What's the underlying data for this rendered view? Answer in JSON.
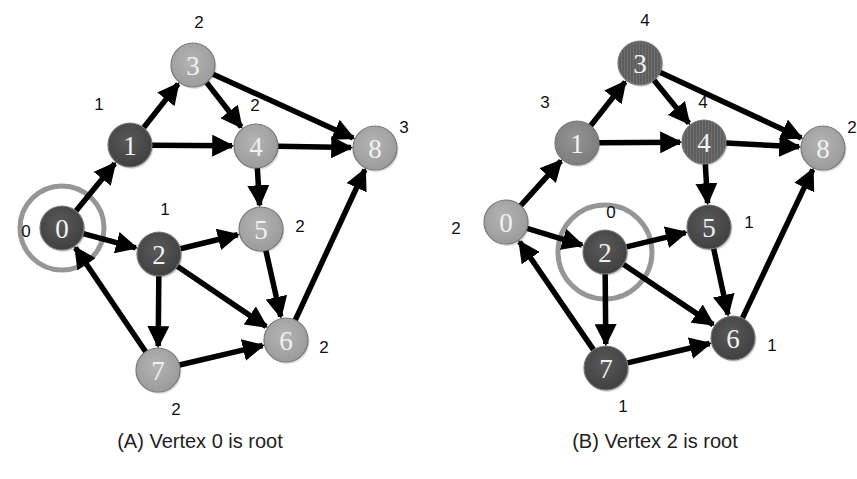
{
  "colors": {
    "dark": "#4d4d4d",
    "medium": "#8a8a8a",
    "light": "#a9a9a9",
    "striped": "#5e5e5e",
    "ring": "#969696",
    "edge": "#000000"
  },
  "edges": [
    [
      0,
      1
    ],
    [
      0,
      2
    ],
    [
      1,
      3
    ],
    [
      1,
      4
    ],
    [
      3,
      4
    ],
    [
      3,
      8
    ],
    [
      4,
      8
    ],
    [
      4,
      5
    ],
    [
      2,
      5
    ],
    [
      2,
      6
    ],
    [
      2,
      7
    ],
    [
      5,
      6
    ],
    [
      7,
      6
    ],
    [
      7,
      0
    ],
    [
      6,
      8
    ]
  ],
  "graphs": [
    {
      "id": "A",
      "caption": "(A) Vertex 0 is root",
      "caption_pos": [
        200,
        448
      ],
      "root": 0,
      "ring": {
        "cx": 62,
        "cy": 228,
        "r": 42
      },
      "nodes": [
        {
          "id": "0",
          "x": 62,
          "y": 228,
          "shade": "dark",
          "depth": "0",
          "lx": 26,
          "ly": 231
        },
        {
          "id": "1",
          "x": 130,
          "y": 145,
          "shade": "dark",
          "depth": "1",
          "lx": 99,
          "ly": 104
        },
        {
          "id": "2",
          "x": 159,
          "y": 254,
          "shade": "dark",
          "depth": "1",
          "lx": 165,
          "ly": 209
        },
        {
          "id": "3",
          "x": 193,
          "y": 65,
          "shade": "light",
          "depth": "2",
          "lx": 199,
          "ly": 22
        },
        {
          "id": "4",
          "x": 256,
          "y": 146,
          "shade": "light",
          "depth": "2",
          "lx": 255,
          "ly": 105
        },
        {
          "id": "5",
          "x": 261,
          "y": 229,
          "shade": "light",
          "depth": "2",
          "lx": 300,
          "ly": 226
        },
        {
          "id": "6",
          "x": 286,
          "y": 340,
          "shade": "light",
          "depth": "2",
          "lx": 324,
          "ly": 347
        },
        {
          "id": "7",
          "x": 158,
          "y": 370,
          "shade": "light",
          "depth": "2",
          "lx": 176,
          "ly": 409
        },
        {
          "id": "8",
          "x": 375,
          "y": 148,
          "shade": "light",
          "depth": "3",
          "lx": 404,
          "ly": 127
        }
      ]
    },
    {
      "id": "B",
      "caption": "(B) Vertex 2 is root",
      "caption_pos": [
        655,
        448
      ],
      "root": 2,
      "ring": {
        "cx": 605,
        "cy": 252,
        "r": 47
      },
      "nodes": [
        {
          "id": "0",
          "x": 506,
          "y": 222,
          "shade": "light",
          "depth": "2",
          "lx": 456,
          "ly": 228
        },
        {
          "id": "1",
          "x": 577,
          "y": 143,
          "shade": "medium",
          "depth": "3",
          "lx": 545,
          "ly": 102
        },
        {
          "id": "2",
          "x": 605,
          "y": 252,
          "shade": "dark",
          "depth": "0",
          "lx": 611,
          "ly": 212
        },
        {
          "id": "3",
          "x": 640,
          "y": 63,
          "shade": "striped",
          "depth": "4",
          "lx": 645,
          "ly": 20
        },
        {
          "id": "4",
          "x": 704,
          "y": 142,
          "shade": "striped",
          "depth": "4",
          "lx": 703,
          "ly": 102
        },
        {
          "id": "5",
          "x": 709,
          "y": 227,
          "shade": "dark",
          "depth": "1",
          "lx": 749,
          "ly": 222
        },
        {
          "id": "6",
          "x": 733,
          "y": 338,
          "shade": "dark",
          "depth": "1",
          "lx": 772,
          "ly": 345
        },
        {
          "id": "7",
          "x": 606,
          "y": 368,
          "shade": "dark",
          "depth": "1",
          "lx": 623,
          "ly": 406
        },
        {
          "id": "8",
          "x": 823,
          "y": 148,
          "shade": "light",
          "depth": "2",
          "lx": 852,
          "ly": 127
        }
      ]
    }
  ]
}
